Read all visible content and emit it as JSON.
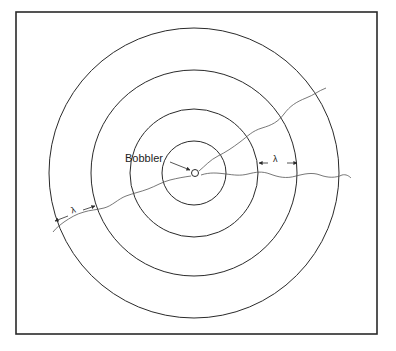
{
  "diagram": {
    "frame": {
      "x": 16,
      "y": 12,
      "width": 361,
      "height": 322
    },
    "center": {
      "x": 194,
      "y": 173
    },
    "rings": [
      {
        "name": "ring-1",
        "radius": 32
      },
      {
        "name": "ring-2",
        "radius": 64
      },
      {
        "name": "ring-3",
        "radius": 103
      },
      {
        "name": "ring-4",
        "radius": 145
      }
    ],
    "source": {
      "label": "Bobbler",
      "radius": 3.5
    },
    "wavelength_markers": [
      {
        "symbol": "λ",
        "position": "right",
        "between": [
          "ring-2",
          "ring-3"
        ]
      },
      {
        "symbol": "λ",
        "position": "lower-left",
        "between": [
          "ring-3",
          "ring-4"
        ]
      }
    ],
    "colors": {
      "stroke": "#2a2a2a",
      "background": "#ffffff"
    }
  },
  "labels": {
    "bobbler": "Bobbler",
    "lambda_right": "λ",
    "lambda_left": "λ"
  }
}
